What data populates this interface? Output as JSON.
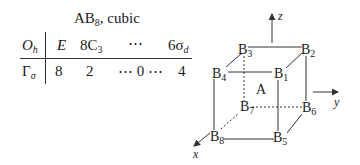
{
  "table": {
    "title": "AB",
    "title_sub": "8",
    "title_suffix": ", cubic",
    "header": {
      "group": "O",
      "group_sub": "h",
      "columns": [
        {
          "label": "E",
          "sub": ""
        },
        {
          "label": "8C",
          "sub": "3"
        },
        {
          "label": "⋯",
          "sub": ""
        },
        {
          "label": "6σ",
          "sub": "d"
        }
      ]
    },
    "row": {
      "label": "Γ",
      "label_sub": "σ",
      "values": [
        "8",
        "2",
        "⋯ 0 ⋯",
        "4"
      ]
    }
  },
  "diagram": {
    "center_atom": "A",
    "vertices": [
      {
        "label": "B",
        "sub": "1"
      },
      {
        "label": "B",
        "sub": "2"
      },
      {
        "label": "B",
        "sub": "3"
      },
      {
        "label": "B",
        "sub": "4"
      },
      {
        "label": "B",
        "sub": "5"
      },
      {
        "label": "B",
        "sub": "6"
      },
      {
        "label": "B",
        "sub": "7"
      },
      {
        "label": "B",
        "sub": "8"
      }
    ],
    "axes": {
      "x": "x",
      "y": "y",
      "z": "z"
    }
  }
}
